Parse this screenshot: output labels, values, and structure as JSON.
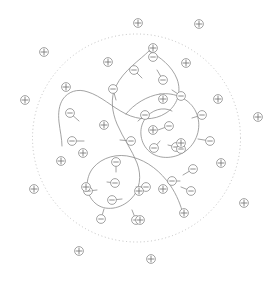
{
  "figure": {
    "width": 279,
    "height": 282,
    "background_color": "#ffffff"
  },
  "colors": {
    "background": "#ffffff",
    "boundary_stroke": "#b3b3b3",
    "backbone_stroke": "#8c8c8c",
    "stem_stroke": "#8c8c8c",
    "ion_ring_stroke": "#8c8c8c",
    "ion_mark_stroke": "#6e6e6e",
    "ion_fill": "#ffffff"
  },
  "boundary": {
    "shape": "dashed-circle",
    "label": "system-boundary",
    "cx": 136.5,
    "cy": 138,
    "r": 104,
    "stroke_width": 0.8,
    "dash_pattern": "1 2.6"
  },
  "backbone": {
    "label": "polymer-backbone",
    "stroke_width": 0.8,
    "paths": [
      "M 149 51 C 140 60, 124 70, 116 86 C 110 98, 112 112, 117 124 C 123 138, 132 150, 137 163 C 142 176, 140 190, 131 199 C 121 209, 105 212, 95 203 C 85 194, 85 178, 93 168 C 102 157, 118 153, 132 157 C 148 161, 161 172, 170 185 C 177 195, 181 206, 183 214",
      "M 149 51 C 160 57, 172 66, 177 79 C 182 92, 177 106, 166 113 C 154 121, 138 120, 126 114 C 112 107, 101 96, 88 92 C 77 88, 68 92, 63 99 C 59 105, 58 113, 59 122 C 60 131, 62 139, 62 146",
      "M 126 114 C 134 104, 147 96, 160 94",
      "M 160 94 C 175 92, 190 99, 196 112 C 202 125, 198 141, 187 150 C 176 159, 160 160, 150 152 C 140 144, 138 129, 145 119 C 151 110, 163 106, 172 111"
    ]
  },
  "pendant_groups": {
    "label": "pendant-anionic-group",
    "charge": "-",
    "stem_width": 0.8,
    "items": [
      {
        "x": 70,
        "y": 113,
        "sx": 79,
        "sy": 121
      },
      {
        "x": 72,
        "y": 141,
        "sx": 84,
        "sy": 141
      },
      {
        "x": 113,
        "y": 89,
        "sx": 116,
        "sy": 100
      },
      {
        "x": 134,
        "y": 70,
        "sx": 142,
        "sy": 78
      },
      {
        "x": 163,
        "y": 80,
        "sx": 157,
        "sy": 70
      },
      {
        "x": 181,
        "y": 96,
        "sx": 172,
        "sy": 90
      },
      {
        "x": 145,
        "y": 115,
        "sx": 138,
        "sy": 121
      },
      {
        "x": 131,
        "y": 141,
        "sx": 120,
        "sy": 140
      },
      {
        "x": 169,
        "y": 126,
        "sx": 158,
        "sy": 130
      },
      {
        "x": 154,
        "y": 148,
        "sx": 160,
        "sy": 141
      },
      {
        "x": 176,
        "y": 147,
        "sx": 168,
        "sy": 145
      },
      {
        "x": 202,
        "y": 115,
        "sx": 192,
        "sy": 118
      },
      {
        "x": 210,
        "y": 141,
        "sx": 198,
        "sy": 139
      },
      {
        "x": 116,
        "y": 162,
        "sx": 116,
        "sy": 172
      },
      {
        "x": 115,
        "y": 183,
        "sx": 107,
        "sy": 182
      },
      {
        "x": 112,
        "y": 200,
        "sx": 122,
        "sy": 199
      },
      {
        "x": 146,
        "y": 187,
        "sx": 136,
        "sy": 187
      },
      {
        "x": 101,
        "y": 219,
        "sx": 104,
        "sy": 209
      },
      {
        "x": 136,
        "y": 220,
        "sx": 132,
        "sy": 210
      },
      {
        "x": 88,
        "y": 191,
        "sx": 97,
        "sy": 190
      },
      {
        "x": 193,
        "y": 169,
        "sx": 183,
        "sy": 175
      },
      {
        "x": 191,
        "y": 191,
        "sx": 181,
        "sy": 187
      },
      {
        "x": 172,
        "y": 181,
        "sx": 180,
        "sy": 181
      },
      {
        "x": 153,
        "y": 57,
        "sx": 152,
        "sy": 51
      },
      {
        "x": 181,
        "y": 149,
        "sx": 174,
        "sy": 146
      }
    ]
  },
  "counterions": {
    "label": "free-counterion",
    "charge": "+",
    "items": [
      {
        "x": 138,
        "y": 23,
        "inside": false
      },
      {
        "x": 199,
        "y": 24,
        "inside": false
      },
      {
        "x": 44,
        "y": 52,
        "inside": false
      },
      {
        "x": 25,
        "y": 100,
        "inside": false
      },
      {
        "x": 258,
        "y": 117,
        "inside": false
      },
      {
        "x": 34,
        "y": 189,
        "inside": false
      },
      {
        "x": 79,
        "y": 251,
        "inside": false
      },
      {
        "x": 151,
        "y": 259,
        "inside": false
      },
      {
        "x": 244,
        "y": 203,
        "inside": false
      },
      {
        "x": 108,
        "y": 62,
        "inside": true
      },
      {
        "x": 186,
        "y": 63,
        "inside": true
      },
      {
        "x": 66,
        "y": 87,
        "inside": true
      },
      {
        "x": 218,
        "y": 99,
        "inside": true
      },
      {
        "x": 163,
        "y": 99,
        "inside": true
      },
      {
        "x": 153,
        "y": 48,
        "inside": true
      },
      {
        "x": 104,
        "y": 125,
        "inside": true
      },
      {
        "x": 153,
        "y": 130,
        "inside": true
      },
      {
        "x": 181,
        "y": 143,
        "inside": true
      },
      {
        "x": 61,
        "y": 161,
        "inside": true
      },
      {
        "x": 83,
        "y": 153,
        "inside": true
      },
      {
        "x": 221,
        "y": 163,
        "inside": true
      },
      {
        "x": 86,
        "y": 187,
        "inside": true
      },
      {
        "x": 139,
        "y": 191,
        "inside": true
      },
      {
        "x": 163,
        "y": 189,
        "inside": true
      },
      {
        "x": 184,
        "y": 213,
        "inside": true
      },
      {
        "x": 140,
        "y": 220,
        "inside": true
      }
    ]
  },
  "ion_geometry": {
    "radius": 4.4,
    "ring_stroke_width": 0.8,
    "mark_stroke_width": 0.8,
    "minus_half_len": 2.3,
    "plus_half_len": 2.9
  }
}
